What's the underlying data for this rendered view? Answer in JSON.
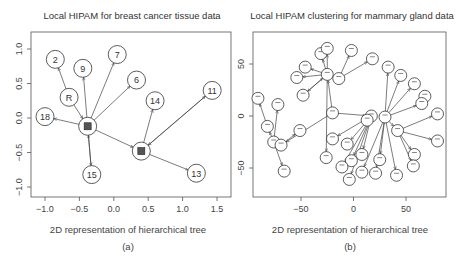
{
  "figure": {
    "panels": [
      {
        "id": "a",
        "title": "Local HIPAM for breast cancer tissue data",
        "xlabel": "2D representation of hierarchical tree",
        "caption": "(a)",
        "xticks": [
          "−1.0",
          "−0.5",
          "0.0",
          "0.5",
          "1.0",
          "1.5"
        ],
        "yticks": [
          "1.0",
          "0.5",
          "0.0",
          "−0.5",
          "−1.0"
        ]
      },
      {
        "id": "b",
        "title": "Local HIPAM clustering for mammary gland data",
        "xlabel": "2D representation of hierarchical tree",
        "caption": "(b)",
        "xticks": [
          "−50",
          "0",
          "50"
        ],
        "yticks": [
          "50",
          "0",
          "−50"
        ]
      }
    ]
  },
  "chart_data": [
    {
      "type": "scatter",
      "subtype": "tree-network",
      "title": "Local HIPAM for breast cancer tissue data",
      "xlabel": "2D representation of hierarchical tree",
      "ylabel": "",
      "caption": "(a)",
      "xlim": [
        -1.2,
        1.7
      ],
      "ylim": [
        -1.2,
        1.2
      ],
      "xticks": [
        -1.0,
        -0.5,
        0.0,
        0.5,
        1.0,
        1.5
      ],
      "yticks": [
        -1.0,
        -0.5,
        0.0,
        0.5,
        1.0
      ],
      "grid": false,
      "nodes": [
        {
          "id": "R",
          "label": "R",
          "x": -0.65,
          "y": 0.3
        },
        {
          "id": "2",
          "label": "2",
          "x": -0.85,
          "y": 0.85
        },
        {
          "id": "9",
          "label": "9",
          "x": -0.45,
          "y": 0.72
        },
        {
          "id": "7",
          "label": "7",
          "x": 0.05,
          "y": 0.92
        },
        {
          "id": "6",
          "label": "6",
          "x": 0.33,
          "y": 0.55
        },
        {
          "id": "18",
          "label": "18",
          "x": -1.0,
          "y": 0.02
        },
        {
          "id": "hubA",
          "label": "",
          "x": -0.38,
          "y": -0.12
        },
        {
          "id": "15",
          "label": "15",
          "x": -0.32,
          "y": -0.82
        },
        {
          "id": "14",
          "label": "14",
          "x": 0.6,
          "y": 0.25
        },
        {
          "id": "11",
          "label": "11",
          "x": 1.43,
          "y": 0.4
        },
        {
          "id": "hubB",
          "label": "",
          "x": 0.4,
          "y": -0.48
        },
        {
          "id": "13",
          "label": "13",
          "x": 1.2,
          "y": -0.8
        }
      ],
      "edges": [
        [
          "R",
          "2"
        ],
        [
          "R",
          "hubA"
        ],
        [
          "hubA",
          "9"
        ],
        [
          "hubA",
          "7"
        ],
        [
          "hubA",
          "6"
        ],
        [
          "hubA",
          "18"
        ],
        [
          "hubA",
          "15"
        ],
        [
          "15",
          "hubA"
        ],
        [
          "hubA",
          "hubB"
        ],
        [
          "hubB",
          "14"
        ],
        [
          "hubB",
          "11"
        ],
        [
          "11",
          "hubB"
        ],
        [
          "hubB",
          "13"
        ]
      ]
    },
    {
      "type": "scatter",
      "subtype": "tree-network",
      "title": "Local HIPAM clustering for mammary gland data",
      "xlabel": "2D representation of hierarchical tree",
      "ylabel": "",
      "caption": "(b)",
      "xlim": [
        -95,
        90
      ],
      "ylim": [
        -80,
        80
      ],
      "xticks": [
        -50,
        0,
        50
      ],
      "yticks": [
        -50,
        0,
        50
      ],
      "grid": false,
      "nodes": [
        {
          "id": "c1",
          "x": -25,
          "y": 40
        },
        {
          "id": "n1",
          "x": -31,
          "y": 60
        },
        {
          "id": "n2",
          "x": -25,
          "y": 65
        },
        {
          "id": "n3",
          "x": -2,
          "y": 63
        },
        {
          "id": "n4",
          "x": 18,
          "y": 55
        },
        {
          "id": "n5",
          "x": -46,
          "y": 47
        },
        {
          "id": "n6",
          "x": -54,
          "y": 37
        },
        {
          "id": "c2",
          "x": -14,
          "y": 36
        },
        {
          "id": "n7",
          "x": -48,
          "y": 20
        },
        {
          "id": "n8",
          "x": -91,
          "y": 17
        },
        {
          "id": "n9",
          "x": -72,
          "y": 11
        },
        {
          "id": "m1",
          "x": -20,
          "y": 3
        },
        {
          "id": "n10",
          "x": -82,
          "y": -10
        },
        {
          "id": "n11",
          "x": -51,
          "y": -14
        },
        {
          "id": "n12",
          "x": -76,
          "y": -25
        },
        {
          "id": "n13",
          "x": -69,
          "y": -28
        },
        {
          "id": "n14",
          "x": -66,
          "y": -53
        },
        {
          "id": "n15",
          "x": -26,
          "y": -40
        },
        {
          "id": "n16",
          "x": -20,
          "y": -22
        },
        {
          "id": "h1",
          "x": 17,
          "y": 0
        },
        {
          "id": "h2",
          "x": 30,
          "y": -1
        },
        {
          "id": "h3",
          "x": 13,
          "y": -4
        },
        {
          "id": "n17",
          "x": 33,
          "y": 47
        },
        {
          "id": "n18",
          "x": 45,
          "y": 39
        },
        {
          "id": "n19",
          "x": 58,
          "y": 31
        },
        {
          "id": "n20",
          "x": 68,
          "y": 19
        },
        {
          "id": "n21",
          "x": 65,
          "y": 12
        },
        {
          "id": "n22",
          "x": 80,
          "y": 2
        },
        {
          "id": "h4",
          "x": 42,
          "y": -14
        },
        {
          "id": "n23",
          "x": 80,
          "y": -24
        },
        {
          "id": "n24",
          "x": 58,
          "y": -37
        },
        {
          "id": "n25",
          "x": 57,
          "y": -48
        },
        {
          "id": "n26",
          "x": -6,
          "y": -27
        },
        {
          "id": "n27",
          "x": -2,
          "y": -43
        },
        {
          "id": "n28",
          "x": 8,
          "y": -37
        },
        {
          "id": "n29",
          "x": -11,
          "y": -49
        },
        {
          "id": "n30",
          "x": 25,
          "y": -42
        },
        {
          "id": "n31",
          "x": 21,
          "y": -55
        },
        {
          "id": "n32",
          "x": 8,
          "y": -54
        },
        {
          "id": "n33",
          "x": -4,
          "y": -61
        },
        {
          "id": "n34",
          "x": 41,
          "y": -57
        }
      ],
      "edges": [
        [
          "c1",
          "n1"
        ],
        [
          "c1",
          "n2"
        ],
        [
          "c1",
          "n5"
        ],
        [
          "c1",
          "n6"
        ],
        [
          "c1",
          "c2"
        ],
        [
          "c1",
          "n7"
        ],
        [
          "c2",
          "n3"
        ],
        [
          "c2",
          "n4"
        ],
        [
          "n7",
          "c1"
        ],
        [
          "m1",
          "c1"
        ],
        [
          "m1",
          "h1"
        ],
        [
          "m1",
          "n13"
        ],
        [
          "n10",
          "n8"
        ],
        [
          "n12",
          "n10"
        ],
        [
          "n12",
          "n9"
        ],
        [
          "n12",
          "n14"
        ],
        [
          "n13",
          "n11"
        ],
        [
          "c1",
          "n15"
        ],
        [
          "h1",
          "n16"
        ],
        [
          "h1",
          "n26"
        ],
        [
          "h1",
          "n29"
        ],
        [
          "h1",
          "n27"
        ],
        [
          "h1",
          "n28"
        ],
        [
          "h1",
          "n33"
        ],
        [
          "h2",
          "n17"
        ],
        [
          "h2",
          "n18"
        ],
        [
          "h2",
          "n19"
        ],
        [
          "h2",
          "n21"
        ],
        [
          "h2",
          "h4"
        ],
        [
          "h2",
          "n30"
        ],
        [
          "h2",
          "n31"
        ],
        [
          "h2",
          "n32"
        ],
        [
          "h2",
          "n34"
        ],
        [
          "n21",
          "n20"
        ],
        [
          "h4",
          "n22"
        ],
        [
          "h4",
          "n23"
        ],
        [
          "h4",
          "n24"
        ],
        [
          "h4",
          "n25"
        ],
        [
          "h3",
          "h1"
        ]
      ]
    }
  ]
}
